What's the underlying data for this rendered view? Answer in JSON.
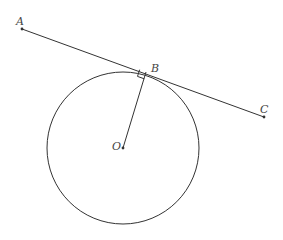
{
  "diagram": {
    "colors": {
      "stroke": "#333333",
      "label": "#444444",
      "background": "#ffffff"
    },
    "circle": {
      "center_label": "O",
      "cx": 123,
      "cy": 148,
      "r": 76
    },
    "points": {
      "A": {
        "label": "A",
        "x": 22,
        "y": 29
      },
      "B": {
        "label": "B",
        "x": 146,
        "y": 72
      },
      "C": {
        "label": "C",
        "x": 264,
        "y": 117
      },
      "O": {
        "label": "O",
        "x": 123,
        "y": 148
      }
    },
    "segments": [
      {
        "from": "A",
        "to": "C",
        "description": "tangent line through B"
      },
      {
        "from": "O",
        "to": "B",
        "description": "radius"
      }
    ],
    "right_angle_marker_at": "B"
  }
}
